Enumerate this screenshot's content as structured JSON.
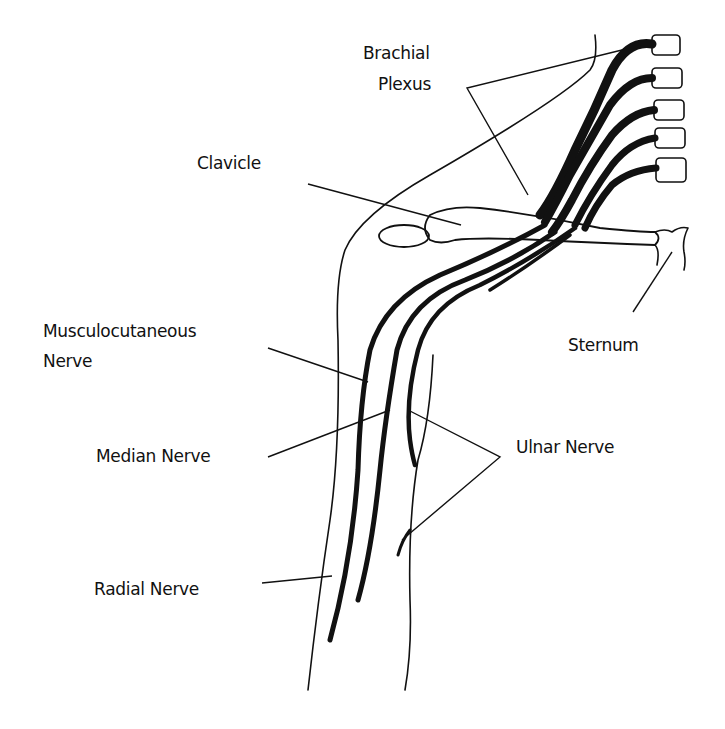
{
  "diagram": {
    "labels": {
      "brachial_plexus_line1": "Brachial",
      "brachial_plexus_line2": "Plexus",
      "clavicle": "Clavicle",
      "musculocutaneous_line1": "Musculocutaneous",
      "musculocutaneous_line2": "Nerve",
      "sternum": "Sternum",
      "median_nerve": "Median Nerve",
      "ulnar_nerve": "Ulnar Nerve",
      "radial_nerve": "Radial Nerve"
    },
    "colors": {
      "ink": "#111111",
      "background": "#ffffff"
    }
  }
}
